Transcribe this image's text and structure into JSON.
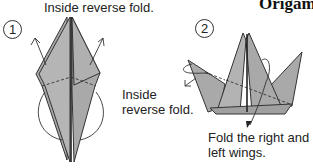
{
  "page": {
    "title": "Origami"
  },
  "steps": [
    {
      "number": "1",
      "caption": "Inside reverse fold."
    },
    {
      "number": "2",
      "caption_left_line1": "Inside",
      "caption_left_line2": "reverse fold.",
      "caption_bottom_line1": "Fold the right and",
      "caption_bottom_line2": "left wings."
    }
  ],
  "colors": {
    "paper_fill": "#a9a9a9",
    "paper_light": "#bdbdbd",
    "line": "#333333",
    "text": "#222222"
  }
}
